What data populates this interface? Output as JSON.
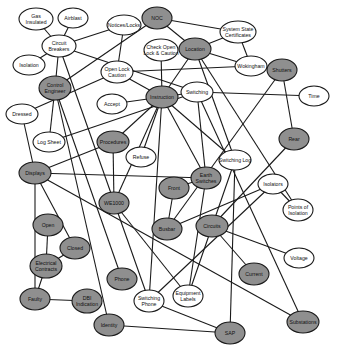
{
  "diagram": {
    "type": "concept-network",
    "colors": {
      "filled": "#8f8f8f",
      "unfilled": "#ffffff",
      "stroke": "#1a1a1a"
    },
    "nodes": [
      {
        "id": "gas_insulated",
        "lines": [
          "Gas",
          "Insulated"
        ],
        "x": 36,
        "y": 19,
        "rx": 17,
        "ry": 11,
        "filled": false
      },
      {
        "id": "airblast",
        "lines": [
          "Airblast"
        ],
        "x": 73,
        "y": 18,
        "rx": 15,
        "ry": 10,
        "filled": false
      },
      {
        "id": "circuit_breakers",
        "lines": [
          "Circuit",
          "Breakers"
        ],
        "x": 59,
        "y": 46,
        "rx": 17,
        "ry": 11,
        "filled": false
      },
      {
        "id": "isolation",
        "lines": [
          "Isolation"
        ],
        "x": 29,
        "y": 65,
        "rx": 16,
        "ry": 10,
        "filled": false
      },
      {
        "id": "notices_locks",
        "lines": [
          "Notices/Locks"
        ],
        "x": 124,
        "y": 25,
        "rx": 17,
        "ry": 10,
        "filled": false
      },
      {
        "id": "noc",
        "lines": [
          "NOC"
        ],
        "x": 157,
        "y": 18,
        "rx": 15,
        "ry": 11,
        "filled": true
      },
      {
        "id": "system_state_certificates",
        "lines": [
          "System State",
          "Certificates"
        ],
        "x": 238,
        "y": 32,
        "rx": 18,
        "ry": 11,
        "filled": false
      },
      {
        "id": "check_open_lock_caution",
        "lines": [
          "Check Open",
          "Lock & Caution"
        ],
        "x": 161,
        "y": 50,
        "rx": 17,
        "ry": 11,
        "filled": false
      },
      {
        "id": "location",
        "lines": [
          "Location"
        ],
        "x": 195,
        "y": 49,
        "rx": 16,
        "ry": 11,
        "filled": true
      },
      {
        "id": "wokingham",
        "lines": [
          "Wokingham"
        ],
        "x": 251,
        "y": 66,
        "rx": 16,
        "ry": 10,
        "filled": false
      },
      {
        "id": "shutters",
        "lines": [
          "Shutters"
        ],
        "x": 282,
        "y": 70,
        "rx": 15,
        "ry": 11,
        "filled": true
      },
      {
        "id": "control_engineer",
        "lines": [
          "Control",
          "Engineer"
        ],
        "x": 55,
        "y": 88,
        "rx": 16,
        "ry": 12,
        "filled": true
      },
      {
        "id": "open_lock_caution",
        "lines": [
          "Open Lock",
          "Caution"
        ],
        "x": 117,
        "y": 72,
        "rx": 16,
        "ry": 11,
        "filled": false
      },
      {
        "id": "switching",
        "lines": [
          "Switching"
        ],
        "x": 197,
        "y": 92,
        "rx": 16,
        "ry": 10,
        "filled": false
      },
      {
        "id": "instruction",
        "lines": [
          "Instruction"
        ],
        "x": 162,
        "y": 97,
        "rx": 16,
        "ry": 11,
        "filled": true
      },
      {
        "id": "accept",
        "lines": [
          "Accept"
        ],
        "x": 112,
        "y": 104,
        "rx": 15,
        "ry": 10,
        "filled": false
      },
      {
        "id": "time",
        "lines": [
          "Time"
        ],
        "x": 314,
        "y": 96,
        "rx": 15,
        "ry": 10,
        "filled": false
      },
      {
        "id": "dressed",
        "lines": [
          "Dressed"
        ],
        "x": 22,
        "y": 114,
        "rx": 16,
        "ry": 10,
        "filled": false
      },
      {
        "id": "log_sheet",
        "lines": [
          "Log Sheet"
        ],
        "x": 49,
        "y": 142,
        "rx": 16,
        "ry": 10,
        "filled": false
      },
      {
        "id": "procedures",
        "lines": [
          "Procedures"
        ],
        "x": 113,
        "y": 142,
        "rx": 16,
        "ry": 11,
        "filled": true
      },
      {
        "id": "refuse",
        "lines": [
          "Refuse"
        ],
        "x": 141,
        "y": 157,
        "rx": 15,
        "ry": 10,
        "filled": false
      },
      {
        "id": "rear",
        "lines": [
          "Rear"
        ],
        "x": 294,
        "y": 139,
        "rx": 15,
        "ry": 11,
        "filled": true
      },
      {
        "id": "switching_log",
        "lines": [
          "Switching Log"
        ],
        "x": 235,
        "y": 160,
        "rx": 16,
        "ry": 10,
        "filled": false
      },
      {
        "id": "displays",
        "lines": [
          "Displays"
        ],
        "x": 35,
        "y": 173,
        "rx": 16,
        "ry": 11,
        "filled": true
      },
      {
        "id": "earth_switches",
        "lines": [
          "Earth",
          "Switches"
        ],
        "x": 206,
        "y": 178,
        "rx": 15,
        "ry": 11,
        "filled": true
      },
      {
        "id": "front",
        "lines": [
          "Front"
        ],
        "x": 174,
        "y": 188,
        "rx": 15,
        "ry": 11,
        "filled": true
      },
      {
        "id": "isolators",
        "lines": [
          "Isolators"
        ],
        "x": 273,
        "y": 184,
        "rx": 15,
        "ry": 10,
        "filled": false
      },
      {
        "id": "we1000",
        "lines": [
          "WE1000"
        ],
        "x": 114,
        "y": 203,
        "rx": 15,
        "ry": 11,
        "filled": true
      },
      {
        "id": "points_of_isolation",
        "lines": [
          "Points of",
          "Isolation"
        ],
        "x": 298,
        "y": 210,
        "rx": 15,
        "ry": 11,
        "filled": false
      },
      {
        "id": "busbar",
        "lines": [
          "Busbar"
        ],
        "x": 167,
        "y": 229,
        "rx": 15,
        "ry": 11,
        "filled": true
      },
      {
        "id": "circuits",
        "lines": [
          "Circuits"
        ],
        "x": 212,
        "y": 226,
        "rx": 16,
        "ry": 11,
        "filled": true
      },
      {
        "id": "open",
        "lines": [
          "Open"
        ],
        "x": 48,
        "y": 225,
        "rx": 15,
        "ry": 11,
        "filled": true
      },
      {
        "id": "closed",
        "lines": [
          "Closed"
        ],
        "x": 75,
        "y": 248,
        "rx": 15,
        "ry": 11,
        "filled": true
      },
      {
        "id": "electrical_contracts",
        "lines": [
          "Electrical",
          "Contracts"
        ],
        "x": 46,
        "y": 266,
        "rx": 16,
        "ry": 12,
        "filled": true
      },
      {
        "id": "voltage",
        "lines": [
          "Voltage"
        ],
        "x": 299,
        "y": 258,
        "rx": 15,
        "ry": 10,
        "filled": false
      },
      {
        "id": "phone",
        "lines": [
          "Phone"
        ],
        "x": 122,
        "y": 279,
        "rx": 15,
        "ry": 11,
        "filled": true
      },
      {
        "id": "current",
        "lines": [
          "Current"
        ],
        "x": 254,
        "y": 274,
        "rx": 15,
        "ry": 11,
        "filled": true
      },
      {
        "id": "faulty",
        "lines": [
          "Faulty"
        ],
        "x": 35,
        "y": 299,
        "rx": 15,
        "ry": 11,
        "filled": true
      },
      {
        "id": "dbi_indication",
        "lines": [
          "DBI",
          "Indication"
        ],
        "x": 87,
        "y": 301,
        "rx": 15,
        "ry": 12,
        "filled": true
      },
      {
        "id": "switching_phone",
        "lines": [
          "Switching",
          "Phone"
        ],
        "x": 149,
        "y": 301,
        "rx": 15,
        "ry": 11,
        "filled": false
      },
      {
        "id": "equipment_labels",
        "lines": [
          "Equipment",
          "Labels"
        ],
        "x": 188,
        "y": 296,
        "rx": 15,
        "ry": 11,
        "filled": false
      },
      {
        "id": "identity",
        "lines": [
          "Identity"
        ],
        "x": 109,
        "y": 325,
        "rx": 15,
        "ry": 11,
        "filled": true
      },
      {
        "id": "sap",
        "lines": [
          "SAP"
        ],
        "x": 230,
        "y": 333,
        "rx": 15,
        "ry": 11,
        "filled": true
      },
      {
        "id": "substations",
        "lines": [
          "Substations"
        ],
        "x": 303,
        "y": 322,
        "rx": 16,
        "ry": 11,
        "filled": true
      }
    ],
    "edges": [
      [
        "gas_insulated",
        "circuit_breakers"
      ],
      [
        "airblast",
        "circuit_breakers"
      ],
      [
        "isolation",
        "circuit_breakers"
      ],
      [
        "circuit_breakers",
        "notices_locks"
      ],
      [
        "circuit_breakers",
        "control_engineer"
      ],
      [
        "circuit_breakers",
        "switching"
      ],
      [
        "circuit_breakers",
        "switching_phone"
      ],
      [
        "noc",
        "system_state_certificates"
      ],
      [
        "noc",
        "location"
      ],
      [
        "noc",
        "control_engineer"
      ],
      [
        "notices_locks",
        "open_lock_caution"
      ],
      [
        "system_state_certificates",
        "location"
      ],
      [
        "system_state_certificates",
        "wokingham"
      ],
      [
        "location",
        "wokingham"
      ],
      [
        "location",
        "instruction"
      ],
      [
        "location",
        "switching_log"
      ],
      [
        "location",
        "points_of_isolation"
      ],
      [
        "check_open_lock_caution",
        "instruction"
      ],
      [
        "wokingham",
        "open_lock_caution"
      ],
      [
        "open_lock_caution",
        "dressed"
      ],
      [
        "open_lock_caution",
        "instruction"
      ],
      [
        "shutters",
        "rear"
      ],
      [
        "shutters",
        "busbar"
      ],
      [
        "switching",
        "time"
      ],
      [
        "switching",
        "instruction"
      ],
      [
        "switching",
        "log_sheet"
      ],
      [
        "switching",
        "earth_switches"
      ],
      [
        "switching",
        "substations"
      ],
      [
        "instruction",
        "accept"
      ],
      [
        "instruction",
        "procedures"
      ],
      [
        "instruction",
        "refuse"
      ],
      [
        "instruction",
        "earth_switches"
      ],
      [
        "instruction",
        "switching_log"
      ],
      [
        "instruction",
        "switching_phone"
      ],
      [
        "instruction",
        "we1000"
      ],
      [
        "control_engineer",
        "log_sheet"
      ],
      [
        "control_engineer",
        "phone"
      ],
      [
        "control_engineer",
        "identity"
      ],
      [
        "dressed",
        "displays"
      ],
      [
        "procedures",
        "displays"
      ],
      [
        "procedures",
        "we1000"
      ],
      [
        "displays",
        "earth_switches"
      ],
      [
        "displays",
        "faulty"
      ],
      [
        "displays",
        "closed"
      ],
      [
        "displays",
        "substations"
      ],
      [
        "rear",
        "circuits"
      ],
      [
        "switching_log",
        "sap"
      ],
      [
        "switching_log",
        "equipment_labels"
      ],
      [
        "earth_switches",
        "front"
      ],
      [
        "earth_switches",
        "equipment_labels"
      ],
      [
        "front",
        "busbar"
      ],
      [
        "isolators",
        "busbar"
      ],
      [
        "isolators",
        "points_of_isolation"
      ],
      [
        "isolators",
        "switching_phone"
      ],
      [
        "circuits",
        "voltage"
      ],
      [
        "circuits",
        "current"
      ],
      [
        "open",
        "electrical_contracts"
      ],
      [
        "closed",
        "electrical_contracts"
      ],
      [
        "electrical_contracts",
        "faulty"
      ],
      [
        "faulty",
        "dbi_indication"
      ],
      [
        "switching_phone",
        "sap"
      ],
      [
        "identity",
        "sap"
      ],
      [
        "we1000",
        "equipment_labels"
      ]
    ]
  }
}
